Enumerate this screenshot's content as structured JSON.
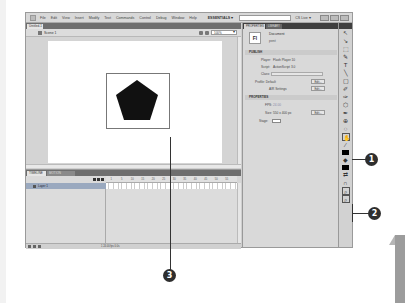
{
  "app": {
    "menu": [
      "File",
      "Edit",
      "View",
      "Insert",
      "Modify",
      "Text",
      "Commands",
      "Control",
      "Debug",
      "Window",
      "Help"
    ],
    "workspace": "ESSENTIALS ▾",
    "search_placeholder": "",
    "cs_live": "CS Live ▾"
  },
  "document": {
    "tab_label": "Untitled-1 ×",
    "scene_label": "Scene 1",
    "zoom": "100%"
  },
  "timeline": {
    "tabs": [
      "TIMELINE",
      "MOTION EDITOR"
    ],
    "layer_name": "Layer 1",
    "frame_numbers": [
      "1",
      "5",
      "10",
      "15",
      "20",
      "25",
      "30",
      "35",
      "40",
      "45",
      "50",
      "55"
    ],
    "status": "1   24.00 fps   0.0s"
  },
  "properties": {
    "tabs": [
      "PROPERTIES",
      "LIBRARY"
    ],
    "doc_type": "Document",
    "doc_name": "pent",
    "publish_section": "PUBLISH",
    "player_label": "Player:",
    "player_value": "Flash Player 10",
    "script_label": "Script:",
    "script_value": "ActionScript 3.0",
    "class_label": "Class:",
    "profile_label": "Profile: Default",
    "edit_label": "Edit...",
    "air_label": "AIR Settings",
    "properties_section": "PROPERTIES",
    "fps_label": "FPS:",
    "fps_value": "24.00",
    "size_label": "Size:",
    "size_value": "550 x 400 px",
    "stage_label": "Stage:"
  },
  "tools": [
    "↖",
    "↘",
    "⬚",
    "✎",
    "T",
    "╲",
    "▢",
    "✐",
    "✑",
    "⬡",
    "✒",
    "⊕",
    "◌",
    "⌕"
  ],
  "callouts": [
    "1",
    "2",
    "3"
  ],
  "colors": {
    "stage_bg": "#ffffff",
    "shape_fill": "#111111",
    "callout_bg": "#2e2e2e"
  }
}
